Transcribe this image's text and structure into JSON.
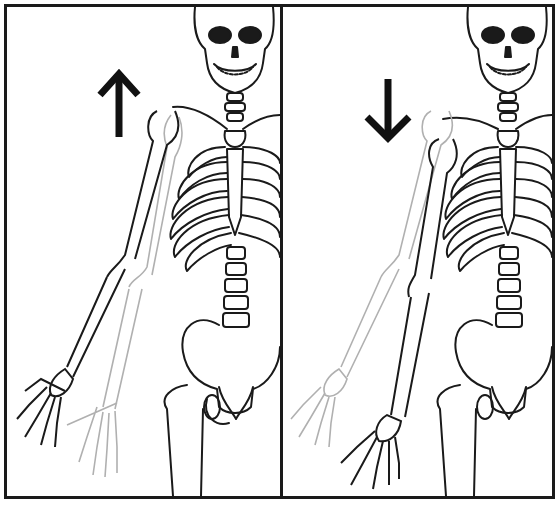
{
  "figure": {
    "panels": [
      {
        "id": "left",
        "arrow": "up-arrow",
        "motion": "arm raised (abduction)",
        "ghost_arm": "lower position"
      },
      {
        "id": "right",
        "arrow": "down-arrow",
        "motion": "arm lowered (adduction)",
        "ghost_arm": "raised position"
      }
    ],
    "colors": {
      "line": "#1a1a1a",
      "ghost": "#b0b0b0",
      "background": "#ffffff",
      "fill": "#ffffff"
    }
  }
}
